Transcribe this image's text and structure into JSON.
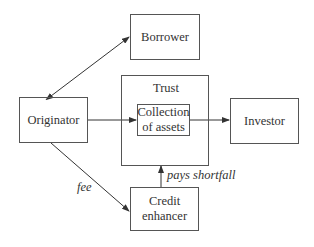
{
  "diagram": {
    "nodes": {
      "borrower": {
        "label": "Borrower"
      },
      "originator": {
        "label": "Originator"
      },
      "trust": {
        "label": "Trust"
      },
      "collection": {
        "line1": "Collection",
        "line2": "of assets"
      },
      "investor": {
        "label": "Investor"
      },
      "credit_enhancer": {
        "line1": "Credit",
        "line2": "enhancer"
      }
    },
    "edges": {
      "originator_borrower": {
        "type": "bidirectional",
        "label": ""
      },
      "originator_collection": {
        "type": "directed",
        "label": ""
      },
      "collection_investor": {
        "type": "directed",
        "label": ""
      },
      "originator_credit_enhancer": {
        "type": "directed",
        "label": "fee"
      },
      "credit_enhancer_trust": {
        "type": "directed",
        "label": "pays shortfall"
      }
    },
    "colors": {
      "line": "#333333",
      "text": "#333333",
      "background": "#ffffff"
    }
  }
}
